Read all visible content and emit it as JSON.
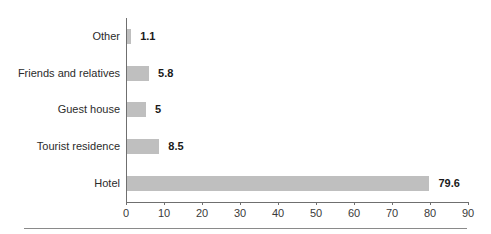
{
  "chart_data": {
    "type": "bar",
    "orientation": "horizontal",
    "title": "",
    "subtitle": "",
    "xlabel": "",
    "ylabel": "",
    "categories": [
      "Other",
      "Friends and relatives",
      "Guest house",
      "Tourist residence",
      "Hotel"
    ],
    "values": [
      1.1,
      5,
      5.8,
      8.5,
      79.6
    ],
    "value_labels": [
      "1.1",
      "5.8",
      "5",
      "8.5",
      "79.6"
    ],
    "bars": [
      {
        "category": "Other",
        "value": 1.1,
        "label": "1.1"
      },
      {
        "category": "Friends and relatives",
        "value": 5.8,
        "label": "5.8"
      },
      {
        "category": "Guest house",
        "value": 5,
        "label": "5"
      },
      {
        "category": "Tourist residence",
        "value": 8.5,
        "label": "8.5"
      },
      {
        "category": "Hotel",
        "value": 79.6,
        "label": "79.6"
      }
    ],
    "xlim": [
      0,
      90
    ],
    "xticks": [
      0,
      10,
      20,
      30,
      40,
      50,
      60,
      70,
      80,
      90
    ],
    "xtick_labels": [
      "0",
      "10",
      "20",
      "30",
      "40",
      "50",
      "60",
      "70",
      "80",
      "90"
    ],
    "grid": false,
    "legend": null,
    "colors": {
      "bar": "#bfbfbf",
      "axis": "#6f6f6f",
      "label_text": "#2b2b2b",
      "value_text": "#1a1a1a",
      "tick_text": "#3a3a3a",
      "background": "#ffffff",
      "rule": "#8a8a8a"
    }
  }
}
